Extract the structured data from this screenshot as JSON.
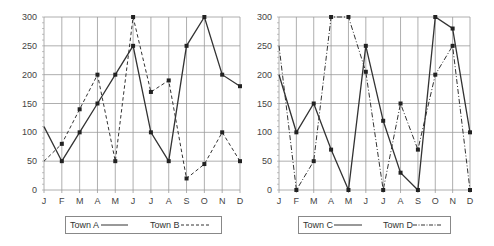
{
  "chart_data": [
    {
      "type": "line",
      "title": "",
      "xlabel": "",
      "ylabel": "",
      "categories": [
        "J",
        "F",
        "M",
        "A",
        "M",
        "J",
        "J",
        "A",
        "S",
        "O",
        "N",
        "D"
      ],
      "yticks": [
        0,
        50,
        100,
        150,
        200,
        250,
        300
      ],
      "ylim": [
        0,
        300
      ],
      "grid": true,
      "legend_position": "bottom",
      "series": [
        {
          "name": "Town A",
          "style": "solid",
          "values": [
            110,
            50,
            100,
            150,
            200,
            250,
            100,
            50,
            250,
            300,
            200,
            180
          ]
        },
        {
          "name": "Town B",
          "style": "dashed",
          "values": [
            50,
            80,
            140,
            200,
            50,
            300,
            170,
            190,
            20,
            45,
            100,
            50
          ]
        }
      ]
    },
    {
      "type": "line",
      "title": "",
      "xlabel": "",
      "ylabel": "",
      "categories": [
        "J",
        "F",
        "M",
        "A",
        "M",
        "J",
        "J",
        "A",
        "S",
        "O",
        "N",
        "D"
      ],
      "yticks": [
        0,
        50,
        100,
        150,
        200,
        250,
        300
      ],
      "ylim": [
        0,
        300
      ],
      "grid": true,
      "legend_position": "bottom",
      "series": [
        {
          "name": "Town C",
          "style": "solid",
          "values": [
            200,
            100,
            150,
            70,
            0,
            250,
            120,
            30,
            0,
            300,
            280,
            100
          ]
        },
        {
          "name": "Town D",
          "style": "dashdot",
          "values": [
            250,
            0,
            50,
            300,
            300,
            205,
            0,
            150,
            70,
            200,
            250,
            0
          ]
        }
      ]
    }
  ],
  "colors": {
    "line": "#333333",
    "grid": "#9a9a9a",
    "marker": "#222222",
    "legend_border": "#888888"
  },
  "legends": [
    {
      "items": [
        {
          "label": "Town A"
        },
        {
          "label": "Town B"
        }
      ]
    },
    {
      "items": [
        {
          "label": "Town C"
        },
        {
          "label": "Town D"
        }
      ]
    }
  ]
}
